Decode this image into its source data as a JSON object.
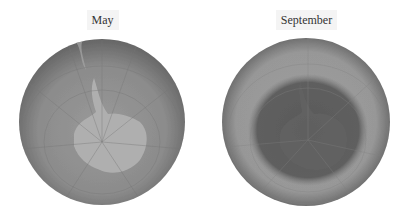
{
  "figure": {
    "panels": [
      {
        "label": "May",
        "globe": {
          "cx": 102,
          "cy": 122,
          "r": 83
        },
        "colors": {
          "ocean_edge": "#6a6a6a",
          "ocean_mid": "#8e8e8e",
          "land": "#b1b1b1",
          "grid": "#777777"
        },
        "description": "Southern hemisphere total ozone, no hole"
      },
      {
        "label": "September",
        "globe": {
          "cx": 102,
          "cy": 122,
          "r": 84
        },
        "colors": {
          "ocean_edge": "#6c6c6c",
          "ocean_mid": "#9a9a9a",
          "hole": "#5f5f5f",
          "grid": "#808080"
        },
        "description": "Southern hemisphere total ozone with ozone hole over Antarctica"
      }
    ]
  }
}
